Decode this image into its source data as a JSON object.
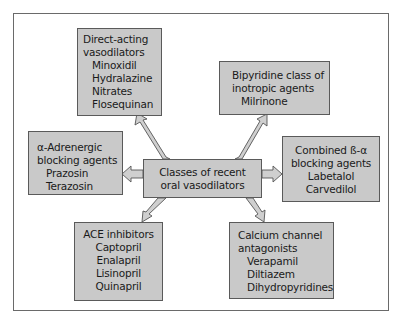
{
  "diagram": {
    "center": {
      "lines": [
        "Classes of recent",
        "oral vasodilators"
      ]
    },
    "nodes": {
      "direct_acting": {
        "title": [
          "Direct-acting",
          "vasodilators"
        ],
        "items": [
          "Minoxidil",
          "Hydralazine",
          "Nitrates",
          "Flosequinan"
        ]
      },
      "bipyridine": {
        "title": [
          "Bipyridine class of",
          "inotropic agents"
        ],
        "items": [
          "Milrinone"
        ]
      },
      "alpha_adrenergic": {
        "title": [
          "α-Adrenergic",
          "blocking agents"
        ],
        "items": [
          "Prazosin",
          "Terazosin"
        ]
      },
      "combined_beta_alpha": {
        "title": [
          "Combined ß-α",
          "blocking agents"
        ],
        "items": [
          "Labetalol",
          "Carvedilol"
        ]
      },
      "ace_inhibitors": {
        "title": [
          "ACE inhibitors"
        ],
        "items": [
          "Captopril",
          "Enalapril",
          "Lisinopril",
          "Quinapril"
        ]
      },
      "calcium_channel": {
        "title": [
          "Calcium channel",
          "antagonists"
        ],
        "items": [
          "Verapamil",
          "Diltiazem",
          "Dihydropyridines"
        ]
      }
    },
    "colors": {
      "box_fill": "#c9c9c9",
      "box_border": "#5a5a5a",
      "arrow_fill": "#cfcfcf",
      "arrow_stroke": "#555555",
      "frame_border": "#6a6a6a"
    }
  }
}
